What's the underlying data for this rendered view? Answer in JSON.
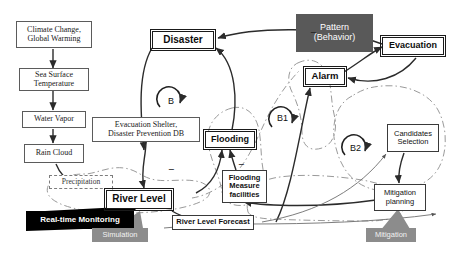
{
  "diagram": {
    "nodes": {
      "climate_change": "Climate Change,\nGlobal Warming",
      "sea_surface_temperature": "Sea Surface\nTemperature",
      "water_vapor": "Water Vapor",
      "rain_cloud": "Rain Cloud",
      "precipitation": "Precipitation",
      "river_level": "River Level",
      "evacuation_shelter_db": "Evacuation Shelter,\nDisaster Prevention DB",
      "disaster": "Disaster",
      "flooding": "Flooding",
      "flooding_measure_facilities": "Flooding\nMeasure\nfacilities",
      "river_level_forecast": "River Level Forecast",
      "alarm": "Alarm",
      "evacuation": "Evacuation",
      "pattern_behavior": "Pattern\n(Behavior)",
      "candidates_selection": "Candidates\nSelection",
      "mitigation_planning": "Mitigation\nplanning",
      "real_time_monitoring": "Real-time Monitoring",
      "simulation": "Simulation",
      "mitigation": "Mitigation"
    },
    "loops": {
      "b": "B",
      "b1": "B1",
      "b2": "B2"
    },
    "polarity_signs": {
      "disaster_link": "−",
      "river_level_link": "−",
      "flooding_measure_link": "−"
    },
    "colors": {
      "pattern_fill": "#595959",
      "banner_gray_fill": "#8c8c8c",
      "monitoring_fill": "#000000",
      "line": "#3a3a3a",
      "dashdot_boundary": "#8a8a8a",
      "background": "#ffffff"
    }
  }
}
